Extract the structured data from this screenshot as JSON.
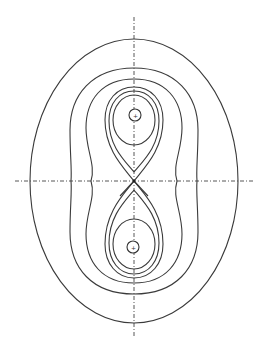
{
  "figure": {
    "type": "equipotential-diagram",
    "stroke_color": "#3a3a3a",
    "background": "#ffffff",
    "axes": {
      "vertical": {
        "x": 134,
        "y1": 17,
        "y2": 338,
        "style": "dash-dot"
      },
      "horizontal": {
        "y": 181,
        "x1": 15,
        "x2": 255,
        "style": "dash-dot"
      }
    },
    "charges": [
      {
        "id": "top",
        "cx": 135,
        "cy": 115,
        "r": 6,
        "label": "+"
      },
      {
        "id": "bottom",
        "cx": 133,
        "cy": 247,
        "r": 6,
        "label": "+"
      }
    ],
    "saddle_point": {
      "x": 134,
      "y": 181
    }
  }
}
